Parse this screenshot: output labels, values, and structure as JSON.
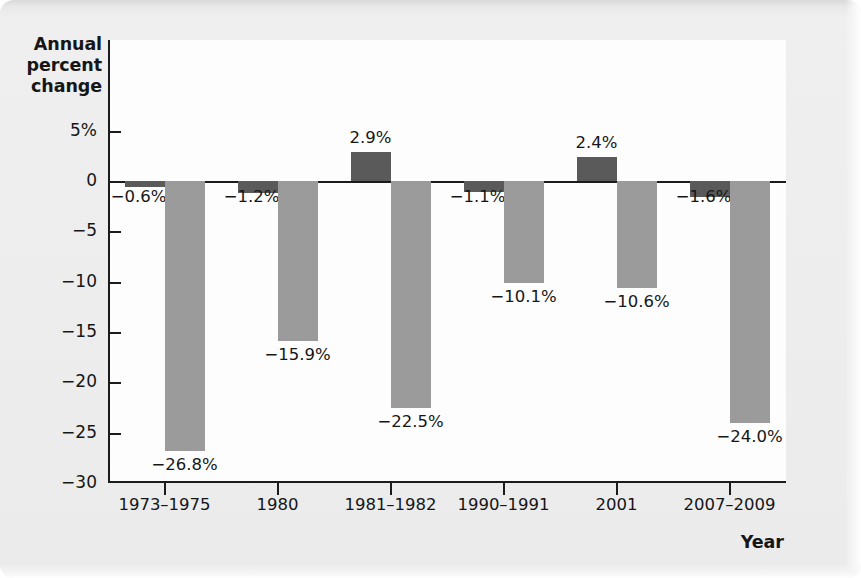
{
  "chart_data": {
    "type": "bar",
    "title": "",
    "xlabel": "Year",
    "ylabel": "Annual percent change",
    "ylim": [
      -30,
      5
    ],
    "grid": false,
    "legend_position": "top-center",
    "categories": [
      "1973–1975",
      "1980",
      "1981–1982",
      "1990–1991",
      "2001",
      "2007–2009"
    ],
    "series": [
      {
        "name": "Consumer spending",
        "color": "#5a5a5a",
        "values": [
          -0.6,
          -1.2,
          2.9,
          -1.1,
          2.4,
          -1.6
        ],
        "labels": [
          "−0.6%",
          "−1.2%",
          "2.9%",
          "−1.1%",
          "2.4%",
          "−1.6%"
        ]
      },
      {
        "name": "Investment spending",
        "color": "#9b9b9b",
        "values": [
          -26.8,
          -15.9,
          -22.5,
          -10.1,
          -10.6,
          -24.0
        ],
        "labels": [
          "−26.8%",
          "−15.9%",
          "−22.5%",
          "−10.1%",
          "−10.6%",
          "−24.0%"
        ]
      }
    ],
    "y_ticks": [
      5,
      0,
      -5,
      -10,
      -15,
      -20,
      -25,
      -30
    ],
    "y_tick_labels": [
      "5%",
      "0",
      "−5",
      "−10",
      "−15",
      "−20",
      "−25",
      "−30"
    ]
  },
  "axes": {
    "y_title_lines": [
      "Annual",
      "percent",
      "change"
    ],
    "y_title": "Annual percent change",
    "x_title": "Year"
  },
  "legend": {
    "items": [
      {
        "label": "Consumer spending",
        "color": "#5a5a5a"
      },
      {
        "label": "Investment spending",
        "color": "#9b9b9b"
      }
    ]
  },
  "colors": {
    "consumer": "#5a5a5a",
    "investment": "#9b9b9b",
    "axis": "#1b1b1b",
    "plot_background": "#fdfdfd",
    "page_background": "#ececed"
  }
}
